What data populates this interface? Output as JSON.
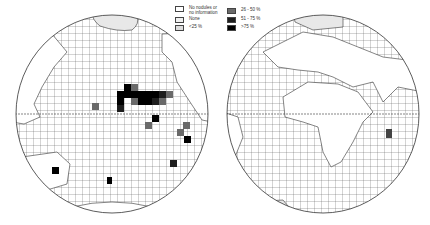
{
  "legend": {
    "items": [
      {
        "label": "No nodules or\nno information",
        "fill": "#ffffff"
      },
      {
        "label": "None",
        "fill": "#f0f0f0"
      },
      {
        "label": "<25 %",
        "fill": "#dcdcdc"
      },
      {
        "label": "26 - 50 %",
        "fill": "#6a6a6a"
      },
      {
        "label": "51 - 75 %",
        "fill": "#1e1e1e"
      },
      {
        "label": ">75 %",
        "fill": "#000000"
      }
    ]
  },
  "maps": [
    {
      "name": "Pacific hemisphere",
      "region": "Pacific Ocean"
    },
    {
      "name": "Atlantic-Indian hemisphere",
      "region": "Atlantic and Indian Oceans"
    }
  ],
  "colors": {
    "grid": "#555555",
    "land": "#ffffff",
    "outline": "#333333"
  }
}
